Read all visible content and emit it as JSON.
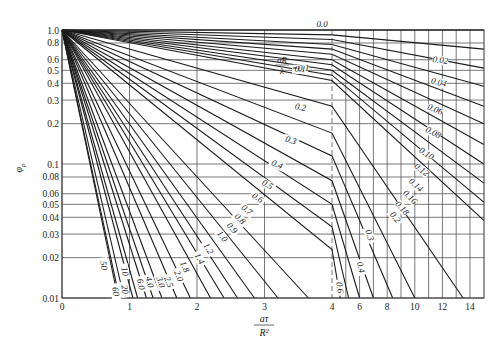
{
  "chart_data": {
    "type": "line",
    "title": "",
    "xlabel": "aτ/R²",
    "xlabel_numerator": "aτ",
    "xlabel_denominator": "R²",
    "ylabel": "φp",
    "ylabel_main": "φ",
    "ylabel_sub": "p",
    "yscale": "log",
    "ylim": [
      0.01,
      1.0
    ],
    "xlim": [
      0,
      15
    ],
    "x_axis_note": "Linear scale 0–4 (one unit per major division), then compressed scale 4–14 (two units per division); dashed vertical line at x=4",
    "x_ticks": [
      "0",
      "1",
      "2",
      "3",
      "4",
      "6",
      "8",
      "10",
      "12",
      "14"
    ],
    "y_ticks": [
      "1.0",
      "0.8",
      "0.6",
      "0.5",
      "0.4",
      "0.3",
      "0.2",
      "0.1",
      "0.08",
      "0.06",
      "0.05",
      "0.04",
      "0.03",
      "0.02",
      "0.01"
    ],
    "grid": true,
    "legend_title": "αR/λ",
    "parameter_name": "αR/λ",
    "series": [
      {
        "name": "0.0",
        "points": [
          [
            0,
            1.0
          ],
          [
            15,
            1.0
          ]
        ]
      },
      {
        "name": "0.02",
        "points": [
          [
            0,
            1.0
          ],
          [
            4,
            0.92
          ],
          [
            15,
            0.72
          ]
        ]
      },
      {
        "name": "0.04",
        "points": [
          [
            0,
            1.0
          ],
          [
            4,
            0.85
          ],
          [
            15,
            0.52
          ]
        ]
      },
      {
        "name": "0.06",
        "points": [
          [
            0,
            1.0
          ],
          [
            4,
            0.78
          ],
          [
            15,
            0.38
          ]
        ]
      },
      {
        "name": "0.08",
        "points": [
          [
            0,
            1.0
          ],
          [
            4,
            0.72
          ],
          [
            15,
            0.27
          ]
        ]
      },
      {
        "name": "0.1",
        "points": [
          [
            0,
            1.0
          ],
          [
            4,
            0.66
          ],
          [
            15,
            0.2
          ]
        ]
      },
      {
        "name": "0.12",
        "points": [
          [
            0,
            1.0
          ],
          [
            4,
            0.6
          ],
          [
            15,
            0.14
          ]
        ]
      },
      {
        "name": "0.14",
        "points": [
          [
            0,
            1.0
          ],
          [
            4,
            0.55
          ],
          [
            15,
            0.1
          ]
        ]
      },
      {
        "name": "0.16",
        "points": [
          [
            0,
            1.0
          ],
          [
            4,
            0.5
          ],
          [
            15,
            0.072
          ]
        ]
      },
      {
        "name": "0.18",
        "points": [
          [
            0,
            1.0
          ],
          [
            4,
            0.46
          ],
          [
            15,
            0.052
          ]
        ]
      },
      {
        "name": "0.2",
        "points": [
          [
            0,
            1.0
          ],
          [
            4,
            0.42
          ],
          [
            15,
            0.038
          ]
        ]
      },
      {
        "name": "0.3",
        "points": [
          [
            0,
            1.0
          ],
          [
            4,
            0.27
          ],
          [
            13.5,
            0.01
          ]
        ]
      },
      {
        "name": "0.4",
        "points": [
          [
            0,
            1.0
          ],
          [
            4,
            0.17
          ],
          [
            10,
            0.01
          ]
        ]
      },
      {
        "name": "0.5",
        "points": [
          [
            0,
            1.0
          ],
          [
            4,
            0.115
          ],
          [
            8.4,
            0.01
          ]
        ]
      },
      {
        "name": "0.6",
        "points": [
          [
            0,
            1.0
          ],
          [
            4,
            0.075
          ],
          [
            7.0,
            0.01
          ]
        ]
      },
      {
        "name": "0.7",
        "points": [
          [
            0,
            1.0
          ],
          [
            4,
            0.05
          ],
          [
            6.0,
            0.01
          ]
        ]
      },
      {
        "name": "0.8",
        "points": [
          [
            0,
            1.0
          ],
          [
            4,
            0.034
          ],
          [
            5.2,
            0.01
          ]
        ]
      },
      {
        "name": "0.9",
        "points": [
          [
            0,
            1.0
          ],
          [
            4,
            0.023
          ],
          [
            4.6,
            0.01
          ]
        ]
      },
      {
        "name": "1.0",
        "points": [
          [
            0,
            1.0
          ],
          [
            3.65,
            0.01
          ]
        ]
      },
      {
        "name": "1.2",
        "points": [
          [
            0,
            1.0
          ],
          [
            3.2,
            0.01
          ]
        ]
      },
      {
        "name": "1.4",
        "points": [
          [
            0,
            1.0
          ],
          [
            2.85,
            0.01
          ]
        ]
      },
      {
        "name": "1.6",
        "points": [
          [
            0,
            1.0
          ],
          [
            2.6,
            0.01
          ]
        ]
      },
      {
        "name": "1.8",
        "points": [
          [
            0,
            1.0
          ],
          [
            2.4,
            0.01
          ]
        ]
      },
      {
        "name": "2.0",
        "points": [
          [
            0,
            1.0
          ],
          [
            2.2,
            0.01
          ]
        ]
      },
      {
        "name": "2.5",
        "points": [
          [
            0,
            1.0
          ],
          [
            1.9,
            0.01
          ]
        ]
      },
      {
        "name": "3.0",
        "points": [
          [
            0,
            1.0
          ],
          [
            1.7,
            0.01
          ]
        ]
      },
      {
        "name": "4.0",
        "points": [
          [
            0,
            1.0
          ],
          [
            1.48,
            0.01
          ]
        ]
      },
      {
        "name": "5.0",
        "points": [
          [
            0,
            1.0
          ],
          [
            1.35,
            0.01
          ]
        ]
      },
      {
        "name": "6.0",
        "points": [
          [
            0,
            1.0
          ],
          [
            1.25,
            0.01
          ]
        ]
      },
      {
        "name": "8.0",
        "points": [
          [
            0,
            1.0
          ],
          [
            1.12,
            0.01
          ]
        ]
      },
      {
        "name": "10",
        "points": [
          [
            0,
            1.0
          ],
          [
            1.05,
            0.01
          ]
        ]
      },
      {
        "name": "20",
        "points": [
          [
            0,
            1.0
          ],
          [
            0.92,
            0.01
          ]
        ]
      },
      {
        "name": "50",
        "points": [
          [
            0,
            1.0
          ],
          [
            0.85,
            0.01
          ]
        ]
      },
      {
        "name": "60",
        "points": [
          [
            0,
            1.0
          ],
          [
            0.83,
            0.01
          ]
        ]
      }
    ],
    "curve_labels": [
      {
        "text": "0.0",
        "x": 322,
        "y": 27,
        "rot": 0
      },
      {
        "text": "0.02",
        "x": 440,
        "y": 63,
        "rot": 8
      },
      {
        "text": "0.04",
        "x": 438,
        "y": 85,
        "rot": 15
      },
      {
        "text": "0.06",
        "x": 434,
        "y": 112,
        "rot": 22
      },
      {
        "text": "0.08",
        "x": 432,
        "y": 135,
        "rot": 28
      },
      {
        "text": "0.10",
        "x": 425,
        "y": 156,
        "rot": 33
      },
      {
        "text": "0.12",
        "x": 420,
        "y": 172,
        "rot": 38
      },
      {
        "text": "0.14",
        "x": 414,
        "y": 187,
        "rot": 42
      },
      {
        "text": "0.16",
        "x": 408,
        "y": 199,
        "rot": 45
      },
      {
        "text": "0.18",
        "x": 400,
        "y": 210,
        "rot": 48
      },
      {
        "text": "0.2",
        "x": 393,
        "y": 219,
        "rot": 52
      },
      {
        "text": "0.1",
        "x": 300,
        "y": 72,
        "rot": 4
      },
      {
        "text": "0.2",
        "x": 300,
        "y": 110,
        "rot": 10
      },
      {
        "text": "0.3",
        "x": 290,
        "y": 143,
        "rot": 18
      },
      {
        "text": "0.4",
        "x": 276,
        "y": 167,
        "rot": 24
      },
      {
        "text": "0.5",
        "x": 266,
        "y": 187,
        "rot": 30
      },
      {
        "text": "0.6",
        "x": 256,
        "y": 200,
        "rot": 35
      },
      {
        "text": "0.7",
        "x": 245,
        "y": 212,
        "rot": 40
      },
      {
        "text": "0.8",
        "x": 238,
        "y": 221,
        "rot": 44
      },
      {
        "text": "0.9",
        "x": 230,
        "y": 230,
        "rot": 48
      },
      {
        "text": "1.0",
        "x": 220,
        "y": 238,
        "rot": 52
      },
      {
        "text": "1.2",
        "x": 206,
        "y": 250,
        "rot": 58
      },
      {
        "text": "1.4",
        "x": 197,
        "y": 260,
        "rot": 62
      },
      {
        "text": "1.8",
        "x": 182,
        "y": 268,
        "rot": 66
      },
      {
        "text": "2.0",
        "x": 176,
        "y": 277,
        "rot": 68
      },
      {
        "text": "2.5",
        "x": 166,
        "y": 283,
        "rot": 70
      },
      {
        "text": "3.0",
        "x": 158,
        "y": 283,
        "rot": 72
      },
      {
        "text": "4.0",
        "x": 147,
        "y": 283,
        "rot": 74
      },
      {
        "text": "6.0",
        "x": 138,
        "y": 285,
        "rot": 76
      },
      {
        "text": "10",
        "x": 122,
        "y": 272,
        "rot": 80
      },
      {
        "text": "20",
        "x": 122,
        "y": 290,
        "rot": 80
      },
      {
        "text": "50",
        "x": 101,
        "y": 266,
        "rot": 82
      },
      {
        "text": "60",
        "x": 113,
        "y": 292,
        "rot": 82
      },
      {
        "text": "0.3",
        "x": 367,
        "y": 236,
        "rot": 72
      },
      {
        "text": "0.4",
        "x": 358,
        "y": 268,
        "rot": 76
      },
      {
        "text": "0.6",
        "x": 337,
        "y": 288,
        "rot": 82
      }
    ],
    "annotation": {
      "text_num": "αR",
      "text_den": "λ",
      "eq": "=0.1",
      "x": 277,
      "y": 63
    }
  },
  "axis": {
    "ylabel_main": "φ",
    "ylabel_sub": "p",
    "xlabel_num": "aτ",
    "xlabel_den": "R²"
  }
}
